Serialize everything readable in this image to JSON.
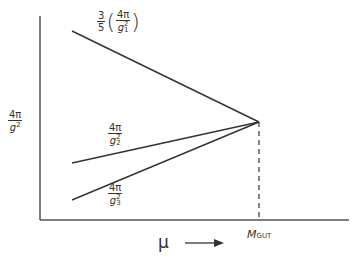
{
  "diagram": {
    "type": "gauge coupling unification",
    "y_axis_label": {
      "numerator": "4π",
      "denominator": "g",
      "sup": "2"
    },
    "x_axis_label": "μ",
    "x_axis_arrow": "arrow-right",
    "marker_label": {
      "main": "M",
      "sub": "GUT"
    },
    "lines": [
      {
        "name": "g1",
        "prefix": "3/5",
        "prefix_num": "3",
        "prefix_den": "5",
        "numerator": "4π",
        "denominator": "g",
        "sup": "2",
        "sub": "1",
        "x1": 72,
        "y1": 31,
        "x2": 259,
        "y2": 122
      },
      {
        "name": "g2",
        "numerator": "4π",
        "denominator": "g",
        "sup": "2",
        "sub": "2",
        "x1": 72,
        "y1": 163,
        "x2": 259,
        "y2": 122
      },
      {
        "name": "g3",
        "numerator": "4π",
        "denominator": "g",
        "sup": "2",
        "sub": "3",
        "x1": 72,
        "y1": 200,
        "x2": 259,
        "y2": 122
      }
    ],
    "colors": {
      "line": "#333333",
      "background": "#ffffff"
    }
  }
}
